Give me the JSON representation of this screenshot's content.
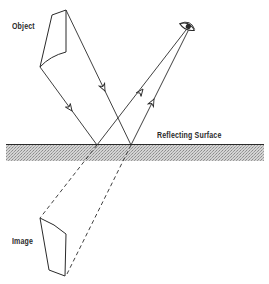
{
  "labels": {
    "object": "Object",
    "image": "Image",
    "surface": "Reflecting Surface"
  },
  "icons": {
    "eye": "eye-icon",
    "arrow": "arrowhead-icon"
  },
  "colors": {
    "ink": "#2a2a2a",
    "surface_hatch": "#b8b8b8",
    "background": "#ffffff"
  },
  "geometry": {
    "surface_y": 144,
    "reflection_points": [
      [
        97,
        145
      ],
      [
        131,
        145
      ]
    ],
    "eye": [
      187,
      27
    ],
    "object_vertices": [
      [
        40,
        67
      ],
      [
        66,
        10
      ]
    ],
    "image_vertices": [
      [
        40,
        218
      ],
      [
        66,
        276
      ]
    ]
  }
}
